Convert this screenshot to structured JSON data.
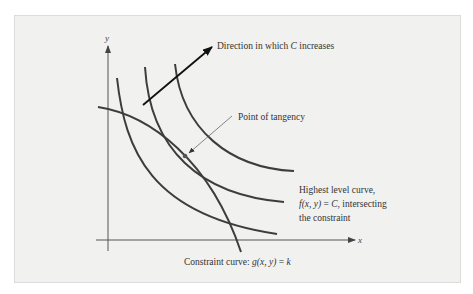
{
  "figure": {
    "type": "diagram",
    "topic": "Lagrange multipliers: level curves and constraint curve",
    "colors": {
      "background": "#ffffff",
      "panel": "#f1f1f0",
      "curve": "#3d3d3d",
      "axis": "#555555",
      "text": "#333333"
    },
    "axes": {
      "x_label": "x",
      "y_label": "y"
    },
    "labels": {
      "direction": {
        "prefix": "Direction in which ",
        "var": "C",
        "suffix": " increases"
      },
      "tangency": "Point of tangency",
      "highest": {
        "line1": "Highest level curve,",
        "line2_f": "f",
        "line2_args": "(x, y)",
        "line2_eq": " = ",
        "line2_C": "C",
        "line2_rest": ", intersecting",
        "line3": "the constraint"
      },
      "constraint": {
        "prefix": "Constraint curve: ",
        "g": "g",
        "args": "(x, y)",
        "eq": " = ",
        "k": "k"
      }
    },
    "curves": [
      {
        "name": "level-curve-low",
        "role": "level curve f(x,y)=C (lower C)"
      },
      {
        "name": "level-curve-tangent",
        "role": "highest level curve intersecting constraint"
      },
      {
        "name": "level-curve-high",
        "role": "level curve f(x,y)=C (higher C)"
      },
      {
        "name": "constraint-curve",
        "role": "g(x,y)=k"
      }
    ]
  }
}
